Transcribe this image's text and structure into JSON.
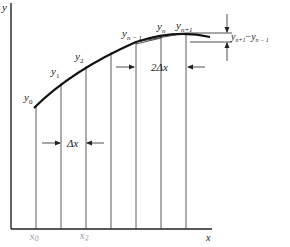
{
  "figure": {
    "axes": {
      "y_label": "y",
      "x_label": "x"
    },
    "ordinate_labels": [
      "y0",
      "y1",
      "y2",
      "yn−1",
      "yn",
      "yn+1"
    ],
    "ordinates": {
      "y0": {
        "base": "y",
        "sub": "0"
      },
      "y1": {
        "base": "y",
        "sub": "1"
      },
      "y2": {
        "base": "y",
        "sub": "2"
      },
      "yn_minus_1": {
        "base": "y",
        "sub": "n − 1"
      },
      "yn": {
        "base": "y",
        "sub": "n"
      },
      "yn_plus_1": {
        "base": "y",
        "sub": "n+1"
      }
    },
    "annotations": {
      "delta_x": "Δx",
      "two_delta_x": "2Δx",
      "difference": {
        "a_base": "y",
        "a_sub": "n+1",
        "minus": "−",
        "b_base": "y",
        "b_sub": "n − 1"
      }
    },
    "handwritten": {
      "x0": {
        "base": "x",
        "sub": "0"
      },
      "x2": {
        "base": "x",
        "sub": "2"
      }
    }
  }
}
